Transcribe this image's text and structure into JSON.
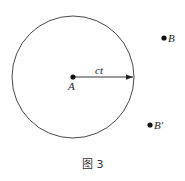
{
  "figure": {
    "caption": "图 3",
    "circle": {
      "cx": 73,
      "cy": 77,
      "r": 61,
      "stroke": "#333333"
    },
    "points": [
      {
        "id": "A",
        "label": "A",
        "x": 73,
        "y": 77
      },
      {
        "id": "B",
        "label": "B",
        "x": 164,
        "y": 38
      },
      {
        "id": "B_prime",
        "label": "B'",
        "x": 150,
        "y": 125
      }
    ],
    "radius_arrow": {
      "label": "ct",
      "from": "A",
      "to_x": 134,
      "to_y": 77
    }
  }
}
